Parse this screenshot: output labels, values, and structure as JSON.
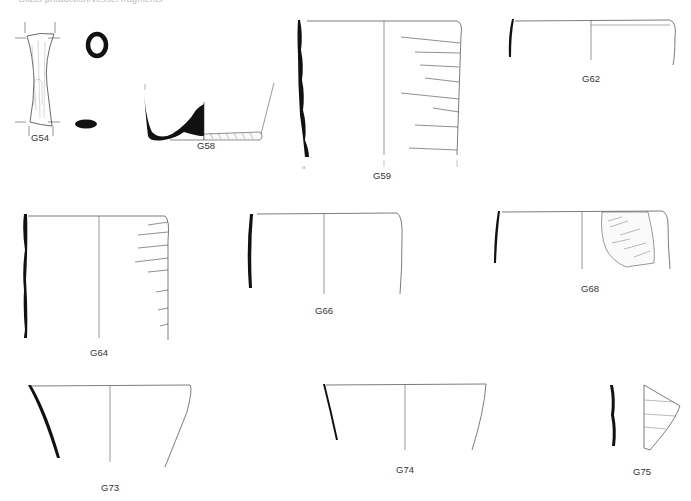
{
  "header": {
    "caption": "Glass production/vessel fragments"
  },
  "figures": [
    {
      "id": "G54",
      "label": "G54",
      "type": "glass-rod/handle fragment with sections"
    },
    {
      "id": "G58",
      "label": "G58",
      "type": "vessel base profile"
    },
    {
      "id": "G59",
      "label": "G59",
      "type": "cup profile with trailed decoration"
    },
    {
      "id": "G62",
      "label": "G62",
      "type": "shallow bowl profile"
    },
    {
      "id": "G64",
      "label": "G64",
      "type": "cup profile with trailed decoration"
    },
    {
      "id": "G66",
      "label": "G66",
      "type": "bowl profile"
    },
    {
      "id": "G68",
      "label": "G68",
      "type": "bowl profile with decorated fragment"
    },
    {
      "id": "G73",
      "label": "G73",
      "type": "flaring beaker profile"
    },
    {
      "id": "G74",
      "label": "G74",
      "type": "flaring beaker profile"
    },
    {
      "id": "G75",
      "label": "G75",
      "type": "body fragment with section"
    }
  ],
  "colors": {
    "ink": "#111111",
    "line": "#555555",
    "background": "#ffffff"
  }
}
